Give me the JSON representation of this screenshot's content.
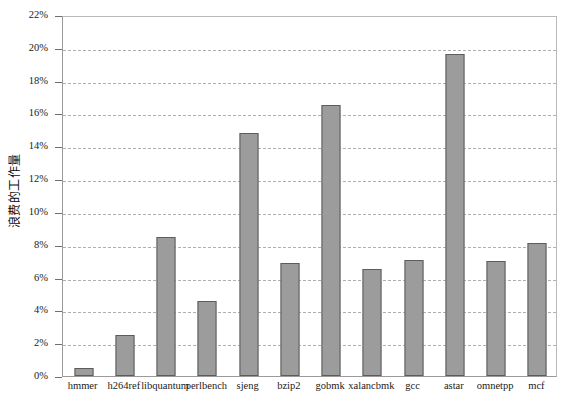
{
  "chart_data": {
    "type": "bar",
    "title": "",
    "subtitle": "",
    "xlabel": "",
    "ylabel": "浪费的工作量",
    "ylim": [
      0,
      22
    ],
    "yunit": "%",
    "grid": true,
    "legend": false,
    "bar_color": "#9c9c9c",
    "bar_border_color": "#5c5c5c",
    "gridline_color": "#b0b0b0",
    "axis_color": "#9a9a9a",
    "ytick_labels": [
      "22%",
      "20%",
      "18%",
      "16%",
      "14%",
      "12%",
      "10%",
      "8%",
      "6%",
      "4%",
      "2%",
      "0%"
    ],
    "ytick_values": [
      22,
      20,
      18,
      16,
      14,
      12,
      10,
      8,
      6,
      4,
      2,
      0
    ],
    "categories": [
      "hmmer",
      "h264ref",
      "libquantum",
      "perlbench",
      "sjeng",
      "bzip2",
      "gobmk",
      "xalancbmk",
      "gcc",
      "astar",
      "omnetpp",
      "mcf"
    ],
    "values": [
      0.5,
      2.5,
      8.5,
      4.6,
      14.8,
      6.9,
      16.5,
      6.5,
      7.1,
      19.6,
      7.0,
      8.1
    ]
  }
}
